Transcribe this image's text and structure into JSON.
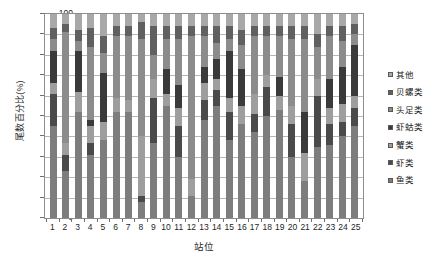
{
  "chart_data": {
    "type": "bar",
    "stacked": true,
    "title": "",
    "xlabel": "站位",
    "ylabel": "尾数百分比(%)",
    "ylim": [
      0,
      100
    ],
    "yticks": [
      0,
      10,
      20,
      30,
      40,
      50,
      60,
      70,
      80,
      90,
      100
    ],
    "grid": true,
    "legend_position": "right",
    "categories": [
      "1",
      "2",
      "3",
      "4",
      "5",
      "6",
      "7",
      "8",
      "9",
      "10",
      "11",
      "12",
      "13",
      "14",
      "15",
      "16",
      "17",
      "18",
      "19",
      "20",
      "21",
      "22",
      "23",
      "24",
      "25"
    ],
    "series": [
      {
        "name": "鱼类",
        "color": "#7d7d7d",
        "values": [
          45,
          23,
          52,
          31,
          38,
          52,
          52,
          8,
          37,
          55,
          30,
          11,
          48,
          55,
          38,
          46,
          42,
          50,
          53,
          30,
          18,
          35,
          36,
          40,
          45
        ]
      },
      {
        "name": "虾类",
        "color": "#4a4a4a",
        "values": [
          16,
          8,
          0,
          6,
          0,
          0,
          0,
          3,
          22,
          0,
          15,
          0,
          10,
          8,
          14,
          0,
          9,
          14,
          0,
          16,
          0,
          25,
          10,
          7,
          9
        ]
      },
      {
        "name": "蟹类",
        "color": "#9e9e9e",
        "values": [
          5,
          6,
          10,
          8,
          9,
          7,
          6,
          29,
          9,
          6,
          9,
          8,
          8,
          5,
          7,
          9,
          10,
          6,
          7,
          9,
          14,
          8,
          8,
          9,
          6
        ]
      },
      {
        "name": "虾蛄类",
        "color": "#3a3a3a",
        "values": [
          16,
          0,
          20,
          3,
          24,
          0,
          0,
          0,
          0,
          12,
          11,
          0,
          8,
          10,
          23,
          18,
          0,
          0,
          9,
          0,
          20,
          0,
          14,
          18,
          25
        ]
      },
      {
        "name": "头足类",
        "color": "#8c8c8c",
        "values": [
          6,
          54,
          5,
          36,
          10,
          30,
          31,
          48,
          12,
          15,
          23,
          70,
          15,
          8,
          6,
          12,
          28,
          19,
          20,
          33,
          36,
          16,
          21,
          13,
          5
        ]
      },
      {
        "name": "贝螺类",
        "color": "#606060",
        "values": [
          5,
          4,
          5,
          9,
          8,
          5,
          5,
          8,
          14,
          6,
          6,
          5,
          5,
          8,
          6,
          7,
          5,
          5,
          5,
          6,
          6,
          6,
          5,
          7,
          5
        ]
      },
      {
        "name": "其他",
        "color": "#a8a8a8",
        "values": [
          7,
          5,
          8,
          7,
          11,
          6,
          6,
          4,
          6,
          6,
          6,
          6,
          6,
          6,
          6,
          8,
          6,
          6,
          6,
          6,
          6,
          10,
          6,
          6,
          5
        ]
      }
    ]
  },
  "axes": {
    "y_title": "尾数百分比(%)",
    "x_title": "站位"
  },
  "legend": {
    "items": [
      {
        "label": "其他",
        "color": "#a8a8a8"
      },
      {
        "label": "贝螺类",
        "color": "#606060"
      },
      {
        "label": "头足类",
        "color": "#8c8c8c"
      },
      {
        "label": "虾蛄类",
        "color": "#3a3a3a"
      },
      {
        "label": "蟹类",
        "color": "#9e9e9e"
      },
      {
        "label": "虾类",
        "color": "#4a4a4a"
      },
      {
        "label": "鱼类",
        "color": "#7d7d7d"
      }
    ]
  }
}
